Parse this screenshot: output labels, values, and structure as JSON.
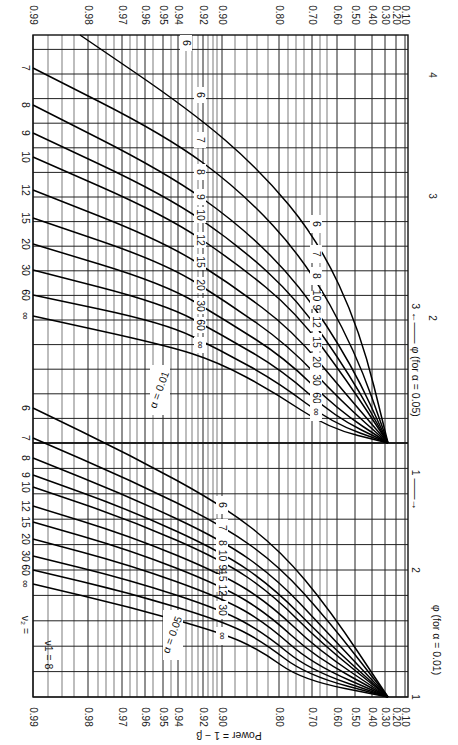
{
  "chart_data": {
    "type": "line",
    "orientation": "rotated 90° clockwise",
    "nu1_label": "ν1 = 8",
    "nu2_label_prefix": "ν2 = ",
    "ylabel": "Power = 1 − β",
    "xlabel_upper": "φ (for α = 0.05)",
    "xlabel_lower": "φ (for α = 0.01)",
    "alpha_labels": [
      "α = 0.05",
      "α = 0.01"
    ],
    "power_ticks": [
      0.99,
      0.98,
      0.97,
      0.96,
      0.95,
      0.94,
      0.92,
      0.9,
      0.8,
      0.7,
      0.6,
      0.5,
      0.4,
      0.3,
      0.2,
      0.1
    ],
    "power_tick_x": [
      33,
      88,
      122,
      145,
      163,
      178,
      203,
      222,
      279,
      312,
      337,
      355,
      372,
      385,
      396,
      405
    ],
    "minor_power_x": [
      48,
      62,
      74,
      98,
      106,
      114,
      130,
      137,
      153,
      171,
      186,
      192,
      198,
      208,
      213,
      217,
      235,
      247,
      257,
      268,
      288,
      296,
      304,
      320,
      327
    ],
    "phi_ticks_alpha_0_05": [
      {
        "v": "1",
        "y": 443
      },
      {
        "v": "2",
        "y": 318
      },
      {
        "v": "3",
        "y": 196
      },
      {
        "v": "4",
        "y": 75
      }
    ],
    "phi_ticks_alpha_0_01": [
      {
        "v": "1",
        "y": 697
      },
      {
        "v": "2",
        "y": 570
      },
      {
        "v": "3",
        "y": 443
      }
    ],
    "grid": {
      "left": 33,
      "right": 408,
      "top": 35,
      "bottom": 697,
      "hline_step": 24.6
    },
    "nu2_values": [
      "6",
      "7",
      "8",
      "9",
      "10",
      "12",
      "15",
      "20",
      "30",
      "60",
      "∞"
    ],
    "series_alpha_0_05": [
      {
        "name": "6",
        "points": [
          [
            80,
            35
          ],
          [
            190,
            110
          ],
          [
            260,
            170
          ],
          [
            318,
            240
          ],
          [
            360,
            330
          ],
          [
            388,
            443
          ]
        ]
      },
      {
        "name": "7",
        "points": [
          [
            33,
            68
          ],
          [
            165,
            135
          ],
          [
            240,
            190
          ],
          [
            305,
            260
          ],
          [
            355,
            350
          ],
          [
            388,
            443
          ]
        ]
      },
      {
        "name": "8",
        "points": [
          [
            33,
            105
          ],
          [
            165,
            172
          ],
          [
            240,
            225
          ],
          [
            300,
            285
          ],
          [
            352,
            365
          ],
          [
            388,
            443
          ]
        ]
      },
      {
        "name": "9",
        "points": [
          [
            33,
            133
          ],
          [
            165,
            195
          ],
          [
            238,
            245
          ],
          [
            298,
            300
          ],
          [
            350,
            375
          ],
          [
            388,
            443
          ]
        ]
      },
      {
        "name": "10",
        "points": [
          [
            33,
            157
          ],
          [
            165,
            215
          ],
          [
            235,
            262
          ],
          [
            296,
            312
          ],
          [
            348,
            382
          ],
          [
            388,
            443
          ]
        ]
      },
      {
        "name": "12",
        "points": [
          [
            33,
            190
          ],
          [
            165,
            242
          ],
          [
            232,
            285
          ],
          [
            292,
            330
          ],
          [
            345,
            393
          ],
          [
            388,
            443
          ]
        ]
      },
      {
        "name": "15",
        "points": [
          [
            33,
            218
          ],
          [
            165,
            263
          ],
          [
            228,
            303
          ],
          [
            288,
            345
          ],
          [
            342,
            402
          ],
          [
            388,
            443
          ]
        ]
      },
      {
        "name": "20",
        "points": [
          [
            33,
            244
          ],
          [
            165,
            284
          ],
          [
            225,
            320
          ],
          [
            285,
            358
          ],
          [
            338,
            410
          ],
          [
            388,
            443
          ]
        ]
      },
      {
        "name": "30",
        "points": [
          [
            33,
            270
          ],
          [
            165,
            304
          ],
          [
            222,
            335
          ],
          [
            282,
            370
          ],
          [
            335,
            417
          ],
          [
            388,
            443
          ]
        ]
      },
      {
        "name": "60",
        "points": [
          [
            33,
            295
          ],
          [
            165,
            323
          ],
          [
            220,
            350
          ],
          [
            278,
            382
          ],
          [
            332,
            423
          ],
          [
            388,
            443
          ]
        ]
      },
      {
        "name": "∞",
        "points": [
          [
            33,
            316
          ],
          [
            165,
            345
          ],
          [
            218,
            362
          ],
          [
            274,
            392
          ],
          [
            328,
            428
          ],
          [
            388,
            443
          ]
        ]
      }
    ],
    "series_alpha_0_01": [
      {
        "name": "6",
        "points": [
          [
            33,
            408
          ],
          [
            130,
            455
          ],
          [
            222,
            505
          ],
          [
            280,
            550
          ],
          [
            330,
            610
          ],
          [
            388,
            697
          ]
        ]
      },
      {
        "name": "7",
        "points": [
          [
            33,
            438
          ],
          [
            130,
            480
          ],
          [
            222,
            525
          ],
          [
            278,
            565
          ],
          [
            328,
            620
          ],
          [
            388,
            697
          ]
        ]
      },
      {
        "name": "8",
        "points": [
          [
            33,
            458
          ],
          [
            130,
            497
          ],
          [
            222,
            540
          ],
          [
            276,
            578
          ],
          [
            325,
            630
          ],
          [
            388,
            697
          ]
        ]
      },
      {
        "name": "9",
        "points": [
          [
            33,
            475
          ],
          [
            130,
            510
          ],
          [
            222,
            552
          ],
          [
            274,
            588
          ],
          [
            323,
            638
          ],
          [
            388,
            697
          ]
        ]
      },
      {
        "name": "10",
        "points": [
          [
            33,
            487
          ],
          [
            130,
            520
          ],
          [
            222,
            560
          ],
          [
            272,
            594
          ],
          [
            321,
            643
          ],
          [
            388,
            697
          ]
        ]
      },
      {
        "name": "12",
        "points": [
          [
            33,
            506
          ],
          [
            130,
            536
          ],
          [
            222,
            574
          ],
          [
            270,
            604
          ],
          [
            318,
            650
          ],
          [
            388,
            697
          ]
        ]
      },
      {
        "name": "15",
        "points": [
          [
            33,
            522
          ],
          [
            130,
            550
          ],
          [
            222,
            586
          ],
          [
            268,
            614
          ],
          [
            315,
            657
          ],
          [
            388,
            697
          ]
        ]
      },
      {
        "name": "20",
        "points": [
          [
            33,
            539
          ],
          [
            130,
            565
          ],
          [
            222,
            598
          ],
          [
            266,
            623
          ],
          [
            312,
            664
          ],
          [
            388,
            697
          ]
        ]
      },
      {
        "name": "30",
        "points": [
          [
            33,
            556
          ],
          [
            130,
            580
          ],
          [
            222,
            610
          ],
          [
            264,
            633
          ],
          [
            309,
            670
          ],
          [
            388,
            697
          ]
        ]
      },
      {
        "name": "60",
        "points": [
          [
            33,
            570
          ],
          [
            130,
            593
          ],
          [
            222,
            621
          ],
          [
            262,
            641
          ],
          [
            306,
            675
          ],
          [
            388,
            697
          ]
        ]
      },
      {
        "name": "∞",
        "points": [
          [
            33,
            584
          ],
          [
            130,
            607
          ],
          [
            222,
            633
          ],
          [
            260,
            650
          ],
          [
            302,
            680
          ],
          [
            388,
            697
          ]
        ]
      }
    ],
    "left_labels_alpha_0_05": [
      {
        "t": "7",
        "y": 68
      },
      {
        "t": "8",
        "y": 105
      },
      {
        "t": "9",
        "y": 133
      },
      {
        "t": "10",
        "y": 157
      },
      {
        "t": "12",
        "y": 190
      },
      {
        "t": "15",
        "y": 218
      },
      {
        "t": "20",
        "y": 244
      },
      {
        "t": "30",
        "y": 270
      },
      {
        "t": "60",
        "y": 295
      },
      {
        "t": "∞",
        "y": 316
      }
    ],
    "left_labels_alpha_0_01": [
      {
        "t": "6",
        "y": 408
      },
      {
        "t": "7",
        "y": 438
      },
      {
        "t": "8",
        "y": 458
      },
      {
        "t": "9",
        "y": 475
      },
      {
        "t": "10",
        "y": 487
      },
      {
        "t": "12",
        "y": 506
      },
      {
        "t": "15",
        "y": 522
      },
      {
        "t": "20",
        "y": 539
      },
      {
        "t": "30",
        "y": 556
      },
      {
        "t": "60",
        "y": 570
      },
      {
        "t": "∞",
        "y": 584
      }
    ],
    "mid_labels_upper_a": [
      {
        "t": "6",
        "x": 186,
        "y": 43
      },
      {
        "t": "6",
        "x": 200,
        "y": 95
      },
      {
        "t": "7",
        "x": 200,
        "y": 140
      },
      {
        "t": "8",
        "x": 200,
        "y": 172
      },
      {
        "t": "9",
        "x": 200,
        "y": 197
      },
      {
        "t": "10",
        "x": 200,
        "y": 215
      },
      {
        "t": "12",
        "x": 200,
        "y": 240
      },
      {
        "t": "15",
        "x": 200,
        "y": 262
      },
      {
        "t": "20",
        "x": 200,
        "y": 285
      },
      {
        "t": "30",
        "x": 200,
        "y": 306
      },
      {
        "t": "60",
        "x": 200,
        "y": 325
      },
      {
        "t": "∞",
        "x": 200,
        "y": 345
      }
    ],
    "mid_labels_upper_b": [
      {
        "t": "6",
        "x": 316,
        "y": 224
      },
      {
        "t": "7",
        "x": 316,
        "y": 254
      },
      {
        "t": "8",
        "x": 316,
        "y": 276
      },
      {
        "t": "10 9",
        "x": 316,
        "y": 300
      },
      {
        "t": "12",
        "x": 316,
        "y": 322
      },
      {
        "t": "15",
        "x": 316,
        "y": 342
      },
      {
        "t": "20",
        "x": 316,
        "y": 362
      },
      {
        "t": "30",
        "x": 316,
        "y": 380
      },
      {
        "t": "60",
        "x": 316,
        "y": 398
      },
      {
        "t": "∞",
        "x": 316,
        "y": 412
      }
    ],
    "mid_labels_lower": [
      {
        "t": "6",
        "x": 222,
        "y": 505
      },
      {
        "t": "7",
        "x": 222,
        "y": 528
      },
      {
        "t": "8",
        "x": 222,
        "y": 543
      },
      {
        "t": "10 9",
        "x": 222,
        "y": 560
      },
      {
        "t": "15 12",
        "x": 222,
        "y": 583
      },
      {
        "t": "30",
        "x": 222,
        "y": 610
      },
      {
        "t": "∞",
        "x": 222,
        "y": 636
      }
    ]
  }
}
